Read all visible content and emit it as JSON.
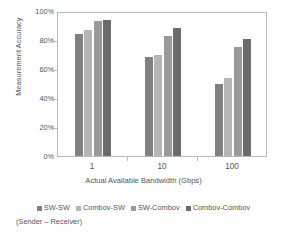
{
  "chart_data": {
    "type": "bar",
    "title": "",
    "xlabel": "Actual Available Bandwidth (Gbps)",
    "ylabel": "Measurement Accuracy",
    "categories": [
      "1",
      "10",
      "100"
    ],
    "xticklabels": [
      "1",
      "10",
      "100"
    ],
    "yticklabels": [
      "0%",
      "20%",
      "40%",
      "60%",
      "80%",
      "100%"
    ],
    "ytickvalues": [
      0,
      20,
      40,
      60,
      80,
      100
    ],
    "ylim": [
      0,
      100
    ],
    "grid": false,
    "legend_position": "bottom",
    "legend_subtitle": "(Sender – Receiver)",
    "series": [
      {
        "name": "SW-SW",
        "color": "#808080",
        "values": [
          84,
          68,
          50
        ]
      },
      {
        "name": "Combov-SW",
        "color": "#b5b5b5",
        "values": [
          87,
          70,
          54
        ]
      },
      {
        "name": "SW-Combov",
        "color": "#9a9a9a",
        "values": [
          93,
          83,
          75
        ]
      },
      {
        "name": "Combov-Combov",
        "color": "#6b6b6b",
        "values": [
          94,
          88,
          81
        ]
      }
    ]
  },
  "axes": {
    "y_title": "Measurement Accuracy",
    "x_title": "Actual Available Bandwidth (Gbps)"
  },
  "legend": {
    "items": [
      {
        "label": "SW-SW",
        "color": "#808080"
      },
      {
        "label": "Combov-SW",
        "color": "#b5b5b5"
      },
      {
        "label": "SW-Combov",
        "color": "#9a9a9a"
      },
      {
        "label": "Combov-Combov",
        "color": "#6b6b6b"
      }
    ],
    "subtitle": "(Sender – Receiver)"
  }
}
